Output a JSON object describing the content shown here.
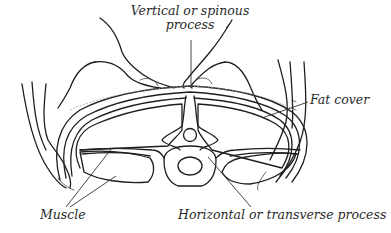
{
  "figure": {
    "labels": {
      "spinous_line1": "Vertical or spinous",
      "spinous_line2": "process",
      "fat_cover": "Fat cover",
      "muscle": "Muscle",
      "transverse": "Horizontal or transverse process"
    },
    "colors": {
      "ink": "#1e1e1e",
      "background": "#ffffff",
      "fat_shading": "#9a9a9a"
    }
  }
}
